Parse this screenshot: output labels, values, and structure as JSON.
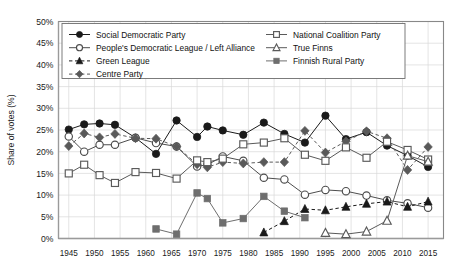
{
  "chart_data": {
    "type": "line",
    "title": "",
    "subtitle": "",
    "xlabel": "",
    "ylabel": "Share of votes (%)",
    "xlim": [
      1943,
      2018
    ],
    "ylim": [
      0,
      50
    ],
    "grid": true,
    "legend_position": "top-inside",
    "x_ticks": [
      1945,
      1950,
      1955,
      1960,
      1965,
      1970,
      1975,
      1980,
      1985,
      1990,
      1995,
      2000,
      2005,
      2010,
      2015
    ],
    "y_ticks": [
      "0%",
      "5%",
      "10%",
      "15%",
      "20%",
      "25%",
      "30%",
      "35%",
      "40%",
      "45%",
      "50%"
    ],
    "y_tick_values": [
      0,
      5,
      10,
      15,
      20,
      25,
      30,
      35,
      40,
      45,
      50
    ],
    "series": [
      {
        "name": "Social Democratic Party",
        "marker": "filled-circle",
        "line": "solid",
        "color": "#1a1a1a",
        "x": [
          1945,
          1948,
          1951,
          1954,
          1958,
          1962,
          1966,
          1970,
          1972,
          1975,
          1979,
          1983,
          1987,
          1991,
          1995,
          1999,
          2003,
          2007,
          2011,
          2015
        ],
        "values": [
          25.1,
          26.3,
          26.5,
          26.2,
          23.2,
          19.5,
          27.2,
          23.4,
          25.8,
          24.9,
          23.9,
          26.7,
          24.1,
          22.1,
          28.3,
          22.9,
          24.5,
          21.4,
          19.1,
          16.5
        ]
      },
      {
        "name": "People's Democratic League / Left Alliance",
        "marker": "open-circle",
        "line": "solid",
        "color": "#4d4d4d",
        "x": [
          1945,
          1948,
          1951,
          1954,
          1958,
          1962,
          1966,
          1970,
          1972,
          1975,
          1979,
          1983,
          1987,
          1991,
          1995,
          1999,
          2003,
          2007,
          2011,
          2015
        ],
        "values": [
          23.5,
          20.0,
          21.6,
          21.6,
          23.2,
          22.0,
          21.2,
          16.6,
          17.0,
          18.9,
          17.9,
          14.0,
          13.6,
          10.1,
          11.2,
          10.9,
          9.9,
          8.8,
          8.1,
          7.1
        ]
      },
      {
        "name": "Green League",
        "marker": "filled-triangle",
        "line": "dashed",
        "color": "#1a1a1a",
        "x": [
          1983,
          1987,
          1991,
          1995,
          1999,
          2003,
          2007,
          2011,
          2015
        ],
        "values": [
          1.4,
          4.0,
          6.8,
          6.5,
          7.3,
          8.0,
          8.5,
          7.3,
          8.5
        ]
      },
      {
        "name": "Centre Party",
        "marker": "filled-diamond",
        "line": "dashed",
        "color": "#595959",
        "x": [
          1945,
          1948,
          1951,
          1954,
          1958,
          1962,
          1966,
          1970,
          1972,
          1975,
          1979,
          1983,
          1987,
          1991,
          1995,
          1999,
          2003,
          2007,
          2011,
          2015
        ],
        "values": [
          21.3,
          24.2,
          23.3,
          24.1,
          23.1,
          23.0,
          21.2,
          17.1,
          16.4,
          17.6,
          17.3,
          17.6,
          17.6,
          24.8,
          19.8,
          22.4,
          24.7,
          23.1,
          15.8,
          21.1
        ]
      },
      {
        "name": "National Coalition Party",
        "marker": "open-square",
        "line": "solid",
        "color": "#5a5a5a",
        "x": [
          1945,
          1948,
          1951,
          1954,
          1958,
          1962,
          1966,
          1970,
          1972,
          1975,
          1979,
          1983,
          1987,
          1991,
          1995,
          1999,
          2003,
          2007,
          2011,
          2015
        ],
        "values": [
          15.0,
          17.0,
          14.6,
          12.8,
          15.3,
          15.1,
          13.8,
          18.0,
          17.6,
          18.4,
          21.7,
          22.1,
          23.1,
          19.3,
          17.9,
          21.0,
          18.6,
          22.3,
          20.4,
          18.2
        ]
      },
      {
        "name": "True Finns",
        "marker": "open-triangle",
        "line": "solid",
        "color": "#5a5a5a",
        "x": [
          1995,
          1999,
          2003,
          2007,
          2011,
          2015
        ],
        "values": [
          1.3,
          1.0,
          1.6,
          4.1,
          19.1,
          17.7
        ]
      },
      {
        "name": "Finnish Rural Party",
        "marker": "filled-square",
        "line": "solid",
        "color": "#6e6e6e",
        "x": [
          1962,
          1966,
          1970,
          1972,
          1975,
          1979,
          1983,
          1987,
          1991
        ],
        "values": [
          2.2,
          1.0,
          10.5,
          9.2,
          3.6,
          4.6,
          9.7,
          6.3,
          4.8
        ]
      }
    ],
    "legend": [
      {
        "label": "Social Democratic Party",
        "marker": "filled-circle",
        "line": "solid",
        "column": 0
      },
      {
        "label": "People's Democratic League / Left Alliance",
        "marker": "open-circle",
        "line": "solid",
        "column": 0
      },
      {
        "label": "Green League",
        "marker": "filled-triangle",
        "line": "dashed",
        "column": 0
      },
      {
        "label": "Centre Party",
        "marker": "filled-diamond",
        "line": "dashed",
        "column": 0
      },
      {
        "label": "National Coalition Party",
        "marker": "open-square",
        "line": "solid",
        "column": 1
      },
      {
        "label": "True Finns",
        "marker": "open-triangle",
        "line": "solid",
        "column": 1
      },
      {
        "label": "Finnish Rural Party",
        "marker": "filled-square",
        "line": "solid",
        "column": 1
      }
    ]
  }
}
